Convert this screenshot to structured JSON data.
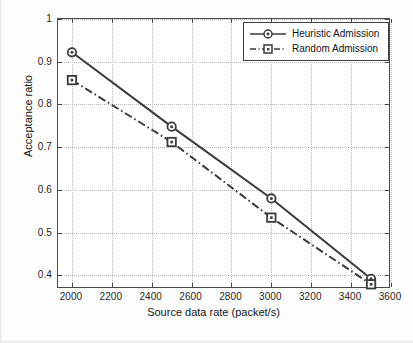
{
  "chart_data": {
    "type": "line",
    "title": "",
    "xlabel": "Source data rate (packet/s)",
    "ylabel": "Acceptance ratio",
    "x": [
      2000,
      2500,
      3000,
      3500
    ],
    "series": [
      {
        "name": "Heuristic Admission",
        "values": [
          0.922,
          0.748,
          0.58,
          0.392
        ],
        "marker": "circle",
        "linestyle": "solid",
        "color": "#3a3a3a"
      },
      {
        "name": "Random Admission",
        "values": [
          0.857,
          0.712,
          0.535,
          0.379
        ],
        "marker": "square",
        "linestyle": "dash-dot",
        "color": "#3a3a3a"
      }
    ],
    "xlim": [
      1930,
      3600
    ],
    "ylim": [
      0.368,
      1.0
    ],
    "xticks": [
      2000,
      2200,
      2400,
      2600,
      2800,
      3000,
      3200,
      3400,
      3600
    ],
    "xticklabels": [
      "2000",
      "2200",
      "2400",
      "2600",
      "2800",
      "3000",
      "3200",
      "3400",
      "3600"
    ],
    "yticks": [
      0.4,
      0.5,
      0.6,
      0.7,
      0.8,
      0.9,
      1.0
    ],
    "yticklabels": [
      "0.4",
      "0.5",
      "0.6",
      "0.7",
      "0.8",
      "0.9",
      "1"
    ],
    "grid": true,
    "grid_style": "dotted",
    "grid_color": "#b9b9b9",
    "legend_position": "top-right",
    "legend_entries": [
      "Heuristic Admission",
      "Random Admission"
    ],
    "axis_color": "#4a4a4a",
    "background": "#ffffff"
  }
}
